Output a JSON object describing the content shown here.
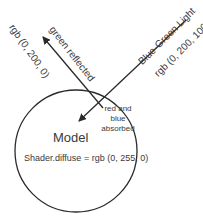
{
  "diagram": {
    "incoming_light": {
      "label": "Blue-Green Light",
      "value": "rgb (0, 200, 100)"
    },
    "reflected_light": {
      "label": "green reflected",
      "value": "rgb (0, 200, 0)"
    },
    "absorbed": {
      "line1": "red and",
      "line2": "blue",
      "line3": "absorbed"
    },
    "model": {
      "title": "Model",
      "shader": "Shader.diffuse = rgb (0, 255, 0)"
    },
    "colors": {
      "stroke": "#2a2a2a",
      "text": "#3a3a3a",
      "background": "#ffffff"
    }
  }
}
